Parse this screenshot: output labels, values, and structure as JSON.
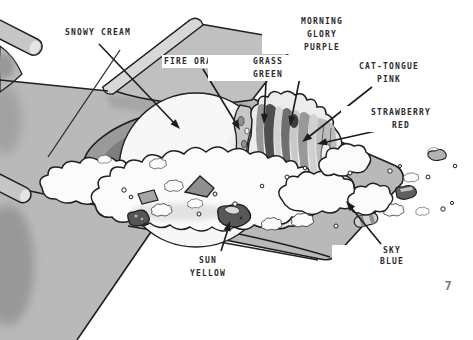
{
  "page": {
    "number": "7"
  },
  "labels": {
    "snowy_cream": [
      "SNOWY CREAM"
    ],
    "fire_orange": [
      "FIRE ORANGE"
    ],
    "grass_green": [
      "GRASS",
      "GREEN"
    ],
    "morning_glory_purple": [
      "MORNING",
      "GLORY",
      "PURPLE"
    ],
    "cat_tongue_pink": [
      "CAT-TONGUE",
      "PINK"
    ],
    "strawberry_red": [
      "STRAWBERRY",
      "RED"
    ],
    "sky_blue": [
      "SKY",
      "BLUE"
    ],
    "sun_yellow": [
      "SUN",
      "YELLOW"
    ]
  },
  "palette": {
    "background": "#ffffff",
    "table_gray": "#b9b9b9",
    "plank_gray": "#c0c0c0",
    "rim_gray": "#d6d6d6",
    "plate_shadow_dark": "#6d6d6d",
    "cream_white": "#fafafa",
    "cake_stripe_dark": "#4e4e4e",
    "outline": "#1f1f1f",
    "label_text": "#2b2b2b",
    "page_number_gray": "#7d7d7d"
  }
}
